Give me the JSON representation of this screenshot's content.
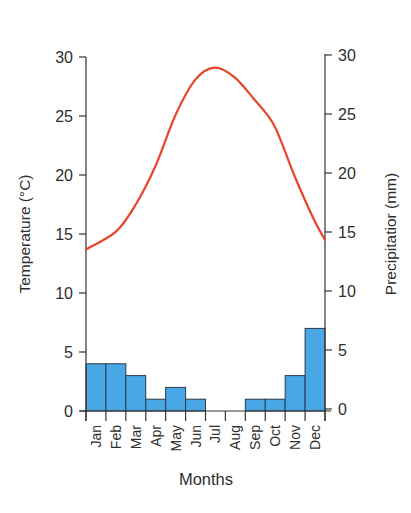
{
  "chart_data": {
    "type": "bar+line",
    "title": "",
    "xlabel": "Months",
    "ylabel_left": "Temperature (°C)",
    "ylabel_right": "Precipitatior (mm)",
    "categories": [
      "Jan",
      "Feb",
      "Mar",
      "Apr",
      "May",
      "Jun",
      "Jul",
      "Aug",
      "Sep",
      "Oct",
      "Nov",
      "Dec"
    ],
    "ylim_left": [
      0,
      30
    ],
    "ylim_right": [
      0,
      30
    ],
    "yticks_left": [
      0,
      5,
      10,
      15,
      20,
      25,
      30
    ],
    "yticks_right": [
      0,
      5,
      10,
      15,
      20,
      25,
      30
    ],
    "grid": false,
    "legend": null,
    "series": [
      {
        "name": "Precipitation (mm)",
        "type": "bar",
        "axis": "right",
        "color": "#4aa7e6",
        "values": [
          4,
          4,
          3,
          1,
          2,
          1,
          0,
          0,
          1,
          1,
          3,
          7
        ]
      },
      {
        "name": "Temperature (°C)",
        "type": "line",
        "axis": "left",
        "color": "#e8442a",
        "values": [
          14.5,
          16.5,
          20.5,
          25.5,
          28.5,
          29,
          28,
          26,
          24,
          20,
          16,
          14.5
        ],
        "curve_points": [
          [
            0,
            13.7
          ],
          [
            1.5,
            15.2
          ],
          [
            2.5,
            17.5
          ],
          [
            3.5,
            20.8
          ],
          [
            4.5,
            25.1
          ],
          [
            5.5,
            28.1
          ],
          [
            6.45,
            29.1
          ],
          [
            7.45,
            28.3
          ],
          [
            8.45,
            26.4
          ],
          [
            9.45,
            24.2
          ],
          [
            10.45,
            20.0
          ],
          [
            11.45,
            16.2
          ],
          [
            12,
            14.5
          ]
        ]
      }
    ]
  },
  "labels": {
    "x_title": "Months",
    "y_left_title": "Temperature (°C)",
    "y_right_title": "Precipitatior (mm)",
    "caption_visible": "(caption cut off at bottom edge)"
  }
}
